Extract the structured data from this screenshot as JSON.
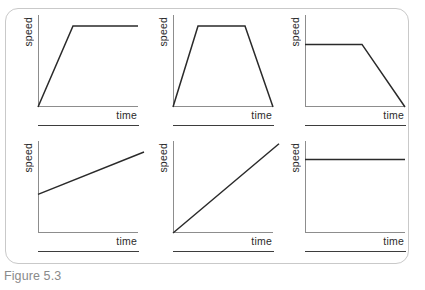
{
  "caption": "Figure 5.3",
  "top_cropped_text": "",
  "colors": {
    "curve": "#2a2a2a",
    "axis": "#8d8d8d",
    "box_border": "#c9c9c9",
    "caption": "#8a8a8a",
    "rule": "#3d3d3d",
    "background": "#ffffff"
  },
  "chart_data": [
    {
      "type": "line",
      "title": "",
      "xlabel": "time",
      "ylabel": "speed",
      "xlim": [
        0,
        100
      ],
      "ylim": [
        0,
        100
      ],
      "grid": false,
      "legend": "none",
      "description": "Speed increases linearly from rest, then stays constant.",
      "points": [
        [
          0,
          0
        ],
        [
          35,
          88
        ],
        [
          100,
          88
        ]
      ]
    },
    {
      "type": "line",
      "title": "",
      "xlabel": "time",
      "ylabel": "speed",
      "xlim": [
        0,
        100
      ],
      "ylim": [
        0,
        100
      ],
      "grid": false,
      "legend": "none",
      "description": "Speed increases from rest, remains constant, then decreases back to rest.",
      "points": [
        [
          0,
          0
        ],
        [
          25,
          88
        ],
        [
          72,
          88
        ],
        [
          100,
          0
        ]
      ]
    },
    {
      "type": "line",
      "title": "",
      "xlabel": "time",
      "ylabel": "speed",
      "xlim": [
        0,
        100
      ],
      "ylim": [
        0,
        100
      ],
      "grid": false,
      "legend": "none",
      "description": "Speed is constant, then decreases steadily to rest.",
      "points": [
        [
          0,
          68
        ],
        [
          57,
          68
        ],
        [
          100,
          0
        ]
      ]
    },
    {
      "type": "line",
      "title": "",
      "xlabel": "time",
      "ylabel": "speed",
      "xlim": [
        0,
        100
      ],
      "ylim": [
        0,
        100
      ],
      "grid": false,
      "legend": "none",
      "description": "Speed increases slowly and steadily from a non-zero starting value.",
      "points": [
        [
          0,
          42
        ],
        [
          106,
          88
        ]
      ]
    },
    {
      "type": "line",
      "title": "",
      "xlabel": "time",
      "ylabel": "speed",
      "xlim": [
        0,
        100
      ],
      "ylim": [
        0,
        100
      ],
      "grid": false,
      "legend": "none",
      "description": "Speed increases steadily from rest at a constant rate.",
      "points": [
        [
          0,
          0
        ],
        [
          106,
          97
        ]
      ]
    },
    {
      "type": "line",
      "title": "",
      "xlabel": "time",
      "ylabel": "speed",
      "xlim": [
        0,
        100
      ],
      "ylim": [
        0,
        100
      ],
      "grid": false,
      "legend": "none",
      "description": "Speed stays constant over time.",
      "points": [
        [
          0,
          80
        ],
        [
          100,
          80
        ]
      ]
    }
  ]
}
